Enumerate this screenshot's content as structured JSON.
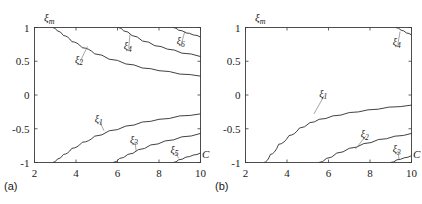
{
  "figure": {
    "background": "#ffffff",
    "stroke_color": "#2b2b2b",
    "axis_color": "#3b3b3b",
    "panels": [
      {
        "id": "a",
        "sub_label": "(a)",
        "ylabel": "ξ",
        "ylabel_sub": "m",
        "xlabel": "C"
      },
      {
        "id": "b",
        "sub_label": "(b)",
        "ylabel": "ξ",
        "ylabel_sub": "m",
        "xlabel": "C"
      }
    ]
  },
  "chart_data": [
    {
      "type": "line",
      "panel": "a",
      "title": "",
      "xlabel": "C",
      "ylabel": "ξ_m",
      "xlim": [
        2,
        10
      ],
      "ylim": [
        -1,
        1
      ],
      "xticks": [
        2,
        4,
        6,
        8,
        10
      ],
      "xticklabels": [
        "2",
        "4",
        "6",
        "8",
        "10"
      ],
      "yticks": [
        -1,
        -0.5,
        0,
        0.5,
        1
      ],
      "yticklabels": [
        "-1",
        "-0.5",
        "0",
        "0.5",
        "1"
      ],
      "grid": false,
      "legend": "inline-annotations",
      "series": [
        {
          "name": "ξ₂",
          "label": "ξ",
          "label_sub": "2",
          "label_xy": [
            3.95,
            0.52
          ],
          "leader_to": [
            4.55,
            0.72
          ],
          "x": [
            2.9,
            3.1,
            3.4,
            3.8,
            4.3,
            4.9,
            5.6,
            6.4,
            7.2,
            8.0,
            9.0,
            10.0
          ],
          "y": [
            1.0,
            0.95,
            0.88,
            0.79,
            0.7,
            0.61,
            0.53,
            0.46,
            0.4,
            0.36,
            0.31,
            0.28
          ]
        },
        {
          "name": "ξ₄",
          "label": "ξ",
          "label_sub": "4",
          "label_xy": [
            6.3,
            0.72
          ],
          "leader_to": [
            6.6,
            0.9
          ],
          "x": [
            6.05,
            6.3,
            6.7,
            7.2,
            7.8,
            8.4,
            9.1,
            10.0
          ],
          "y": [
            1.0,
            0.95,
            0.88,
            0.8,
            0.73,
            0.68,
            0.62,
            0.57
          ]
        },
        {
          "name": "ξ₆",
          "label": "ξ",
          "label_sub": "6",
          "label_xy": [
            8.85,
            0.8
          ],
          "leader_to": [
            9.25,
            0.95
          ],
          "x": [
            8.7,
            8.95,
            9.3,
            9.65,
            10.0
          ],
          "y": [
            1.0,
            0.96,
            0.92,
            0.89,
            0.86
          ]
        },
        {
          "name": "ξ₁",
          "label": "ξ",
          "label_sub": "1",
          "label_xy": [
            4.9,
            -0.36
          ],
          "leader_to": [
            5.35,
            -0.53
          ],
          "x": [
            2.9,
            3.1,
            3.4,
            3.8,
            4.3,
            4.9,
            5.6,
            6.4,
            7.2,
            8.0,
            9.0,
            10.0
          ],
          "y": [
            -1.0,
            -0.95,
            -0.88,
            -0.79,
            -0.7,
            -0.61,
            -0.53,
            -0.46,
            -0.4,
            -0.36,
            -0.31,
            -0.28
          ]
        },
        {
          "name": "ξ₃",
          "label": "ξ",
          "label_sub": "3",
          "label_xy": [
            6.6,
            -0.66
          ],
          "leader_to": [
            6.9,
            -0.83
          ],
          "x": [
            5.8,
            6.1,
            6.5,
            7.0,
            7.6,
            8.3,
            9.1,
            10.0
          ],
          "y": [
            -1.0,
            -0.94,
            -0.88,
            -0.81,
            -0.74,
            -0.68,
            -0.62,
            -0.57
          ]
        },
        {
          "name": "ξ₅",
          "label": "ξ",
          "label_sub": "5",
          "label_xy": [
            8.55,
            -0.82
          ],
          "leader_to": [
            8.95,
            -0.94
          ],
          "x": [
            8.7,
            8.95,
            9.3,
            9.65,
            10.0
          ],
          "y": [
            -1.0,
            -0.96,
            -0.92,
            -0.89,
            -0.86
          ]
        }
      ]
    },
    {
      "type": "line",
      "panel": "b",
      "title": "",
      "xlabel": "C",
      "ylabel": "ξ_m",
      "xlim": [
        2,
        10
      ],
      "ylim": [
        -1,
        1
      ],
      "xticks": [
        2,
        4,
        6,
        8,
        10
      ],
      "xticklabels": [
        "2",
        "4",
        "6",
        "8",
        "10"
      ],
      "yticks": [
        -1,
        -0.5,
        0,
        0.5,
        1
      ],
      "yticklabels": [
        "-1",
        "-0.5",
        "0",
        "0.5",
        "1"
      ],
      "grid": false,
      "legend": "inline-annotations",
      "series": [
        {
          "name": "ξ₄",
          "label": "ξ",
          "label_sub": "4",
          "label_xy": [
            9.1,
            0.78
          ],
          "leader_to": [
            9.45,
            0.94
          ],
          "x": [
            9.25,
            9.5,
            9.75,
            10.0
          ],
          "y": [
            1.0,
            0.96,
            0.92,
            0.89
          ]
        },
        {
          "name": "ξ₁",
          "label": "ξ",
          "label_sub": "1",
          "label_xy": [
            5.55,
            0.02
          ],
          "leader_to": [
            5.3,
            -0.28
          ],
          "x": [
            2.9,
            3.2,
            3.6,
            4.1,
            4.6,
            5.1,
            5.55,
            6.2,
            7.0,
            7.9,
            8.9,
            10.0
          ],
          "y": [
            -1.0,
            -0.88,
            -0.73,
            -0.6,
            -0.49,
            -0.41,
            -0.36,
            -0.31,
            -0.26,
            -0.22,
            -0.18,
            -0.15
          ]
        },
        {
          "name": "ξ₂",
          "label": "ξ",
          "label_sub": "2",
          "label_xy": [
            7.55,
            -0.58
          ],
          "leader_to": [
            7.3,
            -0.8
          ],
          "x": [
            5.55,
            5.9,
            6.4,
            7.0,
            7.7,
            8.4,
            9.2,
            10.0
          ],
          "y": [
            -1.0,
            -0.94,
            -0.86,
            -0.79,
            -0.72,
            -0.66,
            -0.61,
            -0.57
          ]
        },
        {
          "name": "ξ₃",
          "label": "ξ",
          "label_sub": "3",
          "label_xy": [
            9.1,
            -0.8
          ],
          "leader_to": [
            9.4,
            -0.95
          ],
          "x": [
            9.0,
            9.3,
            9.65,
            10.0
          ],
          "y": [
            -1.0,
            -0.96,
            -0.93,
            -0.9
          ]
        }
      ]
    }
  ]
}
